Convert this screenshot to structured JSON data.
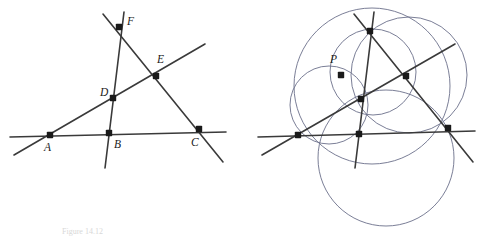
{
  "figure": {
    "caption": "Figure 14.12",
    "background_color": "#ffffff",
    "line_color": "#3a3a3a",
    "circle_color": "#6b6f8a",
    "point_color": "#1a1a1a",
    "label_color": "#1b1b1b",
    "line_width": 1.6,
    "circle_width": 0.9,
    "point_radius": 3.2,
    "panels": [
      {
        "id": "left-panel",
        "name": "complete-quadrilateral",
        "description": "Four lines meeting in six labelled points",
        "points": [
          {
            "id": "A",
            "label": "A",
            "x": 50,
            "y": 135,
            "lx": 44,
            "ly": 151
          },
          {
            "id": "B",
            "label": "B",
            "x": 109,
            "y": 133,
            "lx": 114,
            "ly": 148
          },
          {
            "id": "C",
            "label": "C",
            "x": 199,
            "y": 129,
            "lx": 191,
            "ly": 146
          },
          {
            "id": "D",
            "label": "D",
            "x": 113,
            "y": 98,
            "lx": 100,
            "ly": 96
          },
          {
            "id": "E",
            "label": "E",
            "x": 156,
            "y": 76,
            "lx": 157,
            "ly": 63
          },
          {
            "id": "F",
            "label": "F",
            "x": 119,
            "y": 27,
            "lx": 127,
            "ly": 25
          }
        ],
        "lines": [
          {
            "id": "L1",
            "name": "line-ABC",
            "x1": 10,
            "y1": 137,
            "x2": 226,
            "y2": 132
          },
          {
            "id": "L2",
            "name": "line-ADEF-upper",
            "x1": 14,
            "y1": 155,
            "x2": 205,
            "y2": 44
          },
          {
            "id": "L3",
            "name": "line-FBD-vertical",
            "x1": 124,
            "y1": 12,
            "x2": 105,
            "y2": 168
          },
          {
            "id": "L4",
            "name": "line-FEC",
            "x1": 103,
            "y1": 14,
            "x2": 223,
            "y2": 162
          }
        ]
      },
      {
        "id": "right-panel",
        "name": "miquel-circles",
        "description": "Same quadrilateral with the four circumcircles meeting at the Miquel point P",
        "points": [
          {
            "id": "A2",
            "label": "",
            "x": 298,
            "y": 135,
            "lx": 0,
            "ly": 0
          },
          {
            "id": "B2",
            "label": "",
            "x": 359,
            "y": 134,
            "lx": 0,
            "ly": 0
          },
          {
            "id": "C2",
            "label": "",
            "x": 448,
            "y": 128,
            "lx": 0,
            "ly": 0
          },
          {
            "id": "D2",
            "label": "",
            "x": 361,
            "y": 99,
            "lx": 0,
            "ly": 0
          },
          {
            "id": "E2",
            "label": "",
            "x": 406,
            "y": 76,
            "lx": 0,
            "ly": 0
          },
          {
            "id": "F2",
            "label": "",
            "x": 370,
            "y": 31,
            "lx": 0,
            "ly": 0
          },
          {
            "id": "P",
            "label": "P",
            "x": 341,
            "y": 75,
            "lx": 330,
            "ly": 63
          }
        ],
        "lines": [
          {
            "id": "R1",
            "name": "line-ABC-2",
            "x1": 258,
            "y1": 137,
            "x2": 475,
            "y2": 131
          },
          {
            "id": "R2",
            "name": "line-ADEF-upper-2",
            "x1": 262,
            "y1": 155,
            "x2": 455,
            "y2": 44
          },
          {
            "id": "R3",
            "name": "line-FBD-vertical-2",
            "x1": 374,
            "y1": 12,
            "x2": 355,
            "y2": 168
          },
          {
            "id": "R4",
            "name": "line-FEC-2",
            "x1": 354,
            "y1": 14,
            "x2": 473,
            "y2": 162
          }
        ],
        "circles": [
          {
            "id": "c1",
            "name": "circle-A-P-D-B",
            "cx": 329,
            "cy": 105,
            "r": 39
          },
          {
            "id": "c2",
            "name": "circle-A-P-E-C-big",
            "cx": 372,
            "cy": 86,
            "r": 78
          },
          {
            "id": "c3",
            "name": "circle-P-F-D-E",
            "cx": 373,
            "cy": 72,
            "r": 43
          },
          {
            "id": "c4",
            "name": "circle-B-C-bottom-big",
            "cx": 386,
            "cy": 158,
            "r": 68
          },
          {
            "id": "c5",
            "name": "circle-F-E-C-right",
            "cx": 409,
            "cy": 75,
            "r": 58
          }
        ]
      }
    ]
  }
}
